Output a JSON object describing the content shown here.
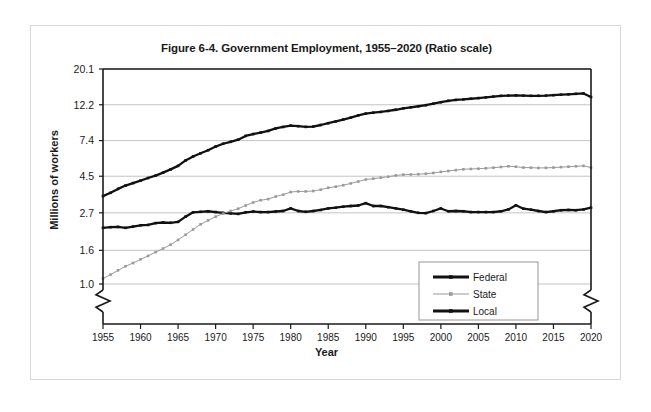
{
  "figure": {
    "title": "Figure 6-4. Government Employment, 1955–2020 (Ratio scale)",
    "xlabel": "Year",
    "ylabel": "Millions of workers"
  },
  "chart_data": {
    "type": "line",
    "title": "Figure 6-4. Government Employment, 1955–2020 (Ratio scale)",
    "xlabel": "Year",
    "ylabel": "Millions of workers",
    "scale": "log",
    "grid": true,
    "legend_position": "lower-right",
    "axis_break_x": true,
    "axis_break_y": true,
    "xlim": [
      1955,
      2020
    ],
    "ylim": [
      1.0,
      20.1
    ],
    "xticks": [
      1955,
      1960,
      1965,
      1970,
      1975,
      1980,
      1985,
      1990,
      1995,
      2000,
      2005,
      2010,
      2015,
      2020
    ],
    "xtick_labels": [
      "1955",
      "1960",
      "1965",
      "1970",
      "1975",
      "1980",
      "1985",
      "1990",
      "1995",
      "2000",
      "2005",
      "2010",
      "2015",
      "2020"
    ],
    "yticks": [
      1.0,
      1.6,
      2.7,
      4.5,
      7.4,
      12.2,
      20.1
    ],
    "ytick_labels": [
      "1.0",
      "1.6",
      "2.7",
      "4.5",
      "7.4",
      "12.2",
      "20.1"
    ],
    "x": [
      1955,
      1956,
      1957,
      1958,
      1959,
      1960,
      1961,
      1962,
      1963,
      1964,
      1965,
      1966,
      1967,
      1968,
      1969,
      1970,
      1971,
      1972,
      1973,
      1974,
      1975,
      1976,
      1977,
      1978,
      1979,
      1980,
      1981,
      1982,
      1983,
      1984,
      1985,
      1986,
      1987,
      1988,
      1989,
      1990,
      1991,
      1992,
      1993,
      1994,
      1995,
      1996,
      1997,
      1998,
      1999,
      2000,
      2001,
      2002,
      2003,
      2004,
      2005,
      2006,
      2007,
      2008,
      2009,
      2010,
      2011,
      2012,
      2013,
      2014,
      2015,
      2016,
      2017,
      2018,
      2019,
      2020
    ],
    "series": [
      {
        "name": "Federal",
        "color": "#111111",
        "style": "thick-solid-no-marker",
        "values": [
          2.19,
          2.21,
          2.22,
          2.19,
          2.23,
          2.27,
          2.28,
          2.34,
          2.36,
          2.35,
          2.38,
          2.56,
          2.72,
          2.74,
          2.76,
          2.73,
          2.7,
          2.68,
          2.66,
          2.72,
          2.75,
          2.73,
          2.73,
          2.75,
          2.77,
          2.87,
          2.77,
          2.74,
          2.77,
          2.81,
          2.87,
          2.9,
          2.94,
          2.97,
          2.99,
          3.09,
          2.97,
          2.97,
          2.92,
          2.87,
          2.82,
          2.76,
          2.7,
          2.69,
          2.77,
          2.87,
          2.76,
          2.77,
          2.76,
          2.73,
          2.73,
          2.73,
          2.73,
          2.76,
          2.83,
          3.0,
          2.86,
          2.82,
          2.77,
          2.73,
          2.76,
          2.8,
          2.81,
          2.8,
          2.83,
          2.9
        ]
      },
      {
        "name": "State",
        "color": "#9a9a9a",
        "style": "thin-solid-with-marker",
        "values": [
          1.08,
          1.14,
          1.21,
          1.28,
          1.34,
          1.41,
          1.48,
          1.56,
          1.64,
          1.73,
          1.85,
          1.99,
          2.14,
          2.3,
          2.43,
          2.56,
          2.67,
          2.77,
          2.86,
          2.99,
          3.12,
          3.22,
          3.27,
          3.39,
          3.48,
          3.61,
          3.64,
          3.64,
          3.66,
          3.73,
          3.83,
          3.89,
          3.97,
          4.07,
          4.18,
          4.3,
          4.35,
          4.41,
          4.47,
          4.55,
          4.6,
          4.61,
          4.63,
          4.66,
          4.71,
          4.78,
          4.84,
          4.9,
          4.96,
          4.98,
          5.0,
          5.03,
          5.07,
          5.12,
          5.17,
          5.14,
          5.08,
          5.07,
          5.05,
          5.06,
          5.08,
          5.11,
          5.14,
          5.17,
          5.2,
          5.08
        ]
      },
      {
        "name": "Local",
        "color": "#111111",
        "style": "thick-solid-with-marker",
        "values": [
          3.41,
          3.57,
          3.77,
          3.95,
          4.09,
          4.23,
          4.39,
          4.54,
          4.73,
          4.95,
          5.2,
          5.61,
          5.93,
          6.2,
          6.47,
          6.81,
          7.08,
          7.28,
          7.49,
          7.9,
          8.11,
          8.28,
          8.47,
          8.77,
          8.95,
          9.12,
          9.05,
          8.96,
          9.0,
          9.2,
          9.43,
          9.67,
          9.93,
          10.2,
          10.53,
          10.79,
          10.92,
          11.04,
          11.19,
          11.38,
          11.61,
          11.78,
          11.95,
          12.13,
          12.38,
          12.64,
          12.89,
          13.05,
          13.14,
          13.27,
          13.39,
          13.53,
          13.68,
          13.81,
          13.87,
          13.92,
          13.86,
          13.82,
          13.83,
          13.87,
          13.95,
          14.04,
          14.12,
          14.22,
          14.29,
          13.59
        ]
      }
    ]
  },
  "legend": {
    "items": [
      {
        "label": "Federal"
      },
      {
        "label": "State"
      },
      {
        "label": "Local"
      }
    ]
  }
}
